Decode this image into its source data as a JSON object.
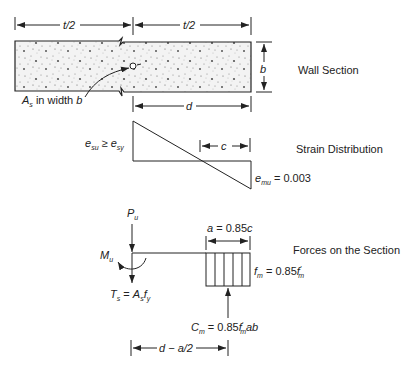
{
  "figure": {
    "panels": [
      {
        "id": "wall-section",
        "caption": "Wall Section"
      },
      {
        "id": "strain",
        "caption": "Strain Distribution"
      },
      {
        "id": "forces",
        "caption": "Forces on the Section"
      }
    ]
  },
  "wall_section": {
    "dim_left": "t/2",
    "dim_right": "t/2",
    "dim_height": "b",
    "dim_d": "d",
    "steel_label_A": "A",
    "steel_label_sub": "s",
    "steel_label_rest": " in width ",
    "steel_label_b": "b",
    "caption": "Wall Section"
  },
  "strain": {
    "left_e1": "e",
    "left_e1_sub": "su",
    "left_op": " ≥ ",
    "left_e2": "e",
    "left_e2_sub": "sy",
    "dim_c": "c",
    "right_e": "e",
    "right_e_sub": "mu",
    "right_val": " = 0.003",
    "caption": "Strain Distribution"
  },
  "forces": {
    "P": "P",
    "P_sub": "u",
    "M": "M",
    "M_sub": "u",
    "T_lhs": "T",
    "T_lhs_sub": "s",
    "T_eq": " = ",
    "T_A": "A",
    "T_A_sub": "s",
    "T_f": "f",
    "T_f_sub": "y",
    "a_label_pre": "a",
    "a_label_mid": " = 0.85",
    "a_label_c": "c",
    "fm_f": "f",
    "fm_sub": "m",
    "fm_eq": " = 0.85",
    "fm_fprime": "f",
    "fm_fprime_sub": "m",
    "fm_prime_mark": "′",
    "C": "C",
    "C_sub": "m",
    "C_eq": " = 0.85",
    "C_f": "f",
    "C_f_sub": "m",
    "C_prime": "′",
    "C_ab": "ab",
    "lever_arm": "d − a/2",
    "caption": "Forces on the Section"
  }
}
